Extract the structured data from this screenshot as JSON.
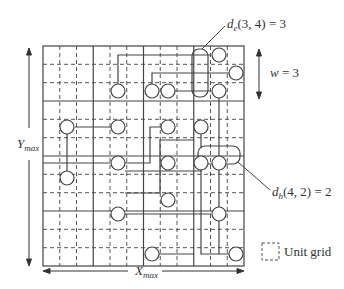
{
  "diagram": {
    "grid": {
      "blocks_x": 4,
      "blocks_y": 4,
      "units_per_block": 3,
      "left": 43,
      "top": 46,
      "right": 244,
      "bottom": 266
    },
    "labels": {
      "de_label_fn": "d",
      "de_label_sub": "e",
      "de_label_args": "(3, 4) = 3",
      "dh_label_fn": "d",
      "dh_label_sub": "h",
      "dh_label_args": "(4, 2) = 2",
      "w_label_var": "w",
      "w_label_val": " = 3",
      "ymax_var": "Y",
      "ymax_sub": "max",
      "xmax_var": "X",
      "xmax_sub": "max",
      "legend_text": "Unit grid"
    },
    "colors": {
      "line": "#444444",
      "dash": "#555555",
      "bg": "#ffffff"
    }
  }
}
